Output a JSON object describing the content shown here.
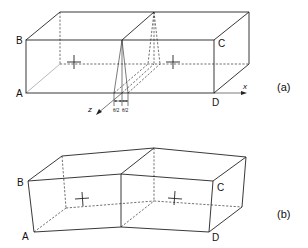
{
  "figure_a": {
    "label": "(a)",
    "vertices": {
      "A": "A",
      "B": "B",
      "C": "C",
      "D": "D"
    },
    "axes": {
      "x": "x",
      "z": "z"
    },
    "wedge_labels": [
      "θ/2",
      "θ/2"
    ]
  },
  "figure_b": {
    "label": "(b)",
    "vertices": {
      "A": "A",
      "B": "B",
      "C": "C",
      "D": "D"
    }
  }
}
